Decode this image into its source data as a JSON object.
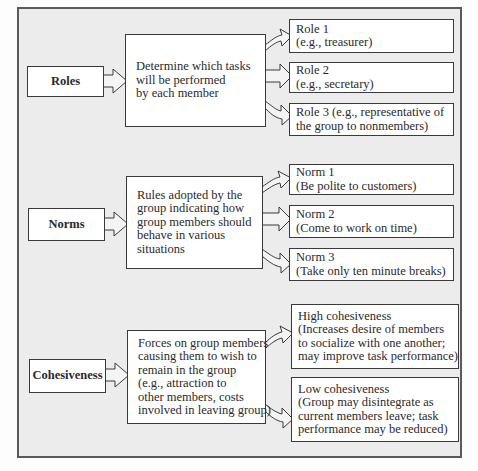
{
  "diagram": {
    "title": "",
    "groups": [
      {
        "category": "Roles",
        "description": [
          "Determine which tasks",
          "will be performed",
          "by each member"
        ],
        "outcomes": [
          {
            "lines": [
              "Role 1",
              "(e.g., treasurer)"
            ]
          },
          {
            "lines": [
              "Role 2",
              "(e.g., secretary)"
            ]
          },
          {
            "lines": [
              "Role 3  (e.g., representative of",
              "the group to nonmembers)"
            ]
          }
        ]
      },
      {
        "category": "Norms",
        "description": [
          "Rules adopted by the",
          "group indicating how",
          "group members should",
          "behave in various",
          "situations"
        ],
        "outcomes": [
          {
            "lines": [
              "Norm 1",
              "(Be polite to customers)"
            ]
          },
          {
            "lines": [
              "Norm 2",
              "(Come to work on time)"
            ]
          },
          {
            "lines": [
              "Norm 3",
              "(Take only ten minute breaks)"
            ]
          }
        ]
      },
      {
        "category": "Cohesiveness",
        "description": [
          "Forces on group members",
          "causing them to wish to",
          "remain in the group",
          "(e.g., attraction to",
          "other members, costs",
          "involved in leaving group)"
        ],
        "outcomes": [
          {
            "lines": [
              "High cohesiveness",
              "(Increases desire of members",
              "to socialize with one another;",
              "may improve task performance)"
            ]
          },
          {
            "lines": [
              "Low cohesiveness",
              "(Group may disintegrate as",
              "current members leave; task",
              "performance may be reduced)"
            ]
          }
        ]
      }
    ],
    "colors": {
      "frame_bg": "#ececec",
      "frame_border": "#5a5a5a",
      "box_bg": "#ffffff",
      "box_border": "#3a3a3a",
      "arrow_fill": "#f4f4f4"
    }
  }
}
